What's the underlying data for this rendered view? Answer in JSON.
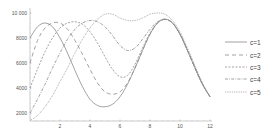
{
  "chart_data": {
    "type": "line",
    "title": "",
    "xlabel": "",
    "ylabel": "",
    "xlim": [
      0,
      12
    ],
    "ylim": [
      1400,
      10400
    ],
    "grid": false,
    "legend_position": "right",
    "x_ticks": [
      2,
      4,
      6,
      8,
      10,
      12
    ],
    "x_tick_labels": [
      "2",
      "4",
      "6",
      "8",
      "10",
      "12"
    ],
    "y_ticks": [
      2000,
      4000,
      6000,
      8000,
      10000
    ],
    "y_tick_labels": [
      "2000",
      "4000",
      "6000",
      "8000",
      "10 000"
    ],
    "x": [
      0,
      0.5,
      1,
      1.5,
      2,
      2.5,
      3,
      3.5,
      4,
      4.5,
      5,
      5.5,
      6,
      6.5,
      7,
      7.5,
      8,
      8.5,
      9,
      9.5,
      10,
      10.5,
      11,
      11.5,
      12
    ],
    "series": [
      {
        "name": "c=1",
        "dash": "",
        "values": [
          8000,
          8900,
          9200,
          8900,
          8000,
          6800,
          5400,
          4100,
          3100,
          2600,
          2500,
          2700,
          3300,
          4300,
          5600,
          7000,
          8300,
          9200,
          9500,
          9200,
          8300,
          7000,
          5600,
          4300,
          3300
        ]
      },
      {
        "name": "c=2",
        "dash": "4,3",
        "values": [
          6000,
          7800,
          8800,
          9200,
          9200,
          8700,
          7800,
          6700,
          5500,
          4400,
          3700,
          3500,
          3700,
          4400,
          5600,
          7000,
          8300,
          9200,
          9500,
          9200,
          8300,
          7000,
          5600,
          4300,
          3300
        ]
      },
      {
        "name": "c=3",
        "dash": "2,1.5",
        "values": [
          4000,
          5500,
          6900,
          8000,
          8800,
          9200,
          9300,
          9100,
          8500,
          7600,
          6500,
          5500,
          4900,
          5000,
          5900,
          7200,
          8400,
          9200,
          9500,
          9200,
          8300,
          7000,
          5600,
          4300,
          3300
        ]
      },
      {
        "name": "c=4",
        "dash": "3,1.2,0.8,1.2",
        "values": [
          2000,
          3100,
          4300,
          5600,
          6800,
          7900,
          8700,
          9200,
          9400,
          9300,
          8900,
          8200,
          7400,
          7000,
          7200,
          7900,
          8700,
          9300,
          9500,
          9200,
          8300,
          7000,
          5600,
          4300,
          3300
        ]
      },
      {
        "name": "c=5",
        "dash": "0.8,1",
        "values": [
          1400,
          1800,
          2500,
          3400,
          4500,
          5600,
          6800,
          7900,
          8800,
          9500,
          9900,
          9900,
          9600,
          9400,
          9400,
          9600,
          9900,
          10000,
          9900,
          9400,
          8500,
          7200,
          5800,
          4400,
          3300
        ]
      }
    ]
  },
  "legend": {
    "items": [
      {
        "label": "c=1"
      },
      {
        "label": "c=2"
      },
      {
        "label": "c=3"
      },
      {
        "label": "c=4"
      },
      {
        "label": "c=5"
      }
    ]
  },
  "colors": {
    "line": "#8a8a8a",
    "axis": "#aaaaaa",
    "text": "#555555"
  }
}
